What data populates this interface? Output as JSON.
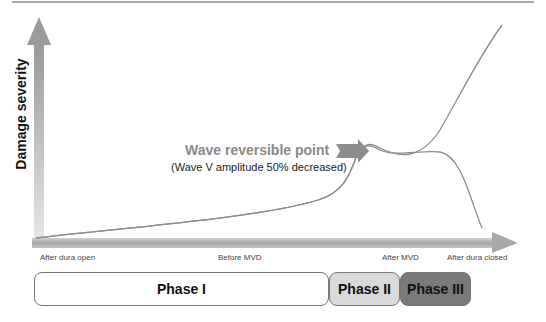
{
  "diagram": {
    "y_axis_label": "Damage severity",
    "annotation": {
      "title": "Wave reversible point",
      "subtitle": "(Wave V amplitude 50% decreased)"
    },
    "x_axis_labels": [
      "After dura open",
      "Before MVD",
      "After MVD",
      "After dura closed"
    ],
    "phases": [
      {
        "label": "Phase I",
        "fill": "#ffffff"
      },
      {
        "label": "Phase II",
        "fill": "#d9d9d9"
      },
      {
        "label": "Phase III",
        "fill": "#7a7a7a"
      }
    ],
    "colors": {
      "axis": "#a0a0a0",
      "curve": "#8c8c8c",
      "arrow": "#8c8c8c"
    }
  }
}
